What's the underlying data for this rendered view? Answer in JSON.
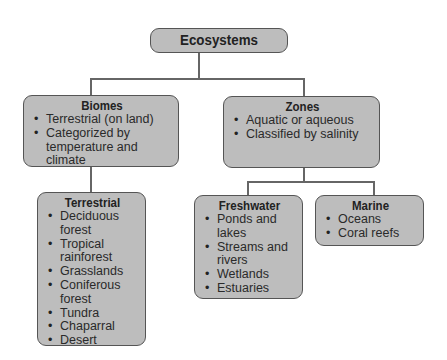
{
  "diagram": {
    "root": {
      "title": "Ecosystems"
    },
    "biomes": {
      "title": "Biomes",
      "items": [
        "Terrestrial (on land)",
        "Categorized by temperature and climate"
      ]
    },
    "zones": {
      "title": "Zones",
      "items": [
        "Aquatic or aqueous",
        "Classified by salinity"
      ]
    },
    "terrestrial": {
      "title": "Terrestrial",
      "items": [
        "Deciduous forest",
        "Tropical rainforest",
        "Grasslands",
        "Coniferous forest",
        "Tundra",
        "Chaparral",
        "Desert"
      ]
    },
    "freshwater": {
      "title": "Freshwater",
      "items": [
        "Ponds and lakes",
        "Streams and rivers",
        "Wetlands",
        "Estuaries"
      ]
    },
    "marine": {
      "title": "Marine",
      "items": [
        "Oceans",
        "Coral reefs"
      ]
    }
  },
  "colors": {
    "box_fill": "#bdbdbd",
    "box_border": "#555555",
    "connector": "#666666"
  }
}
